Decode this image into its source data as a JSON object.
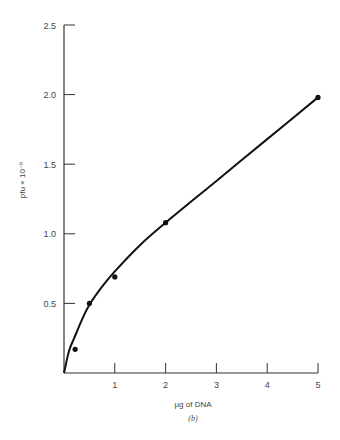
{
  "chart_data": {
    "type": "line",
    "title": "",
    "caption": "(b)",
    "xlabel": "μg of DNA",
    "ylabel": "pfu × 10⁻⁹",
    "xlim": [
      0,
      5
    ],
    "ylim": [
      0,
      2.5
    ],
    "x_ticks": [
      1,
      2,
      3,
      4,
      5
    ],
    "x_tick_labels": [
      "1",
      "2",
      "3",
      "4",
      "5"
    ],
    "y_ticks": [
      0.5,
      1.0,
      1.5,
      2.0,
      2.5
    ],
    "y_tick_labels": [
      "0.5",
      "1.0",
      "1.5",
      "2.0",
      "2.5"
    ],
    "grid": false,
    "legend": null,
    "series": [
      {
        "name": "measured",
        "style": "points",
        "x": [
          0.2,
          0.5,
          1.0,
          2.0,
          5.0
        ],
        "y": [
          0.17,
          0.5,
          0.69,
          1.08,
          1.98
        ]
      },
      {
        "name": "fitted curve",
        "style": "smooth line",
        "x": [
          0,
          0.1,
          0.2,
          0.35,
          0.5,
          0.75,
          1.0,
          1.5,
          2.0,
          3.0,
          4.0,
          5.0
        ],
        "y": [
          0,
          0.16,
          0.25,
          0.38,
          0.49,
          0.62,
          0.73,
          0.92,
          1.08,
          1.38,
          1.68,
          1.98
        ]
      }
    ]
  }
}
